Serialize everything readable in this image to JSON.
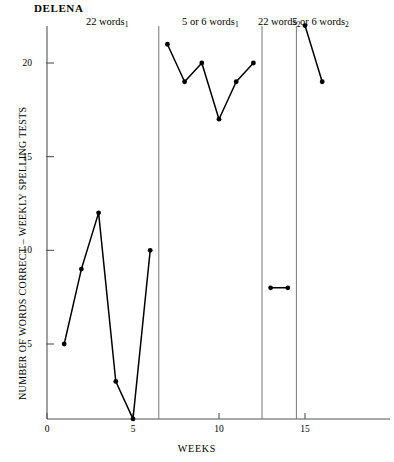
{
  "chart": {
    "subject_title": "DELENA",
    "xlabel": "WEEKS",
    "ylabel": "NUMBER OF WORDS CORRECT – WEEKLY SPELLING TESTS",
    "y_ticks": [
      "5",
      "10",
      "15",
      "20"
    ],
    "x_ticks": [
      "0",
      "5",
      "10",
      "15"
    ]
  },
  "phase_labels": [
    {
      "text": "22 words",
      "sub": "1"
    },
    {
      "text": "5 or 6 words",
      "sub": "1"
    },
    {
      "text": "22 words",
      "sub": "2"
    },
    {
      "text": "5 or 6 words",
      "sub": "2"
    }
  ],
  "chart_data": {
    "type": "line",
    "title": "DELENA",
    "xlabel": "WEEKS",
    "ylabel": "NUMBER OF WORDS CORRECT – WEEKLY SPELLING TESTS",
    "xlim": [
      0,
      18
    ],
    "ylim": [
      0,
      22
    ],
    "x_ticks": [
      0,
      5,
      10,
      15
    ],
    "y_ticks": [
      5,
      10,
      15,
      20
    ],
    "grid": false,
    "legend": null,
    "marker": "filled-circle",
    "phase_change_lines_x": [
      6.5,
      12.5,
      14.5
    ],
    "series": [
      {
        "name": "22 words₁",
        "phase": "22 words 1",
        "x": [
          1,
          2,
          3,
          4,
          5,
          6
        ],
        "values": [
          5,
          9,
          12,
          3,
          1,
          10
        ]
      },
      {
        "name": "5 or 6 words₁",
        "phase": "5 or 6 words 1",
        "x": [
          7,
          8,
          9,
          10,
          11,
          12
        ],
        "values": [
          21,
          19,
          20,
          17,
          19,
          20
        ]
      },
      {
        "name": "22 words₂",
        "phase": "22 words 2",
        "x": [
          13,
          14
        ],
        "values": [
          8,
          8
        ]
      },
      {
        "name": "5 or 6 words₂",
        "phase": "5 or 6 words 2",
        "x": [
          15,
          16
        ],
        "values": [
          22,
          19
        ]
      }
    ]
  }
}
